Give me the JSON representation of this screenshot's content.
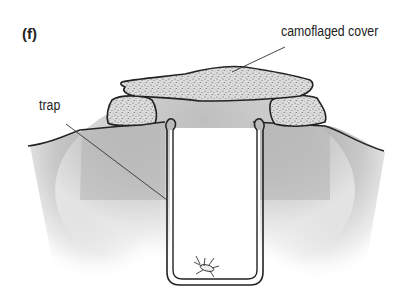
{
  "figure": {
    "panel_label": "(f)"
  },
  "labels": {
    "cover": "camoflaged cover",
    "trap": "trap"
  },
  "components": [
    {
      "name": "camouflaged-cover",
      "description": "flat stippled slab resting on two stones"
    },
    {
      "name": "support-stones",
      "count": 2
    },
    {
      "name": "trap-container",
      "description": "U-shaped cup sunk into soil with rolled rim"
    },
    {
      "name": "insect",
      "location": "bottom of trap"
    },
    {
      "name": "soil",
      "description": "gray shaded ground surface"
    }
  ],
  "colors": {
    "outline": "#222222",
    "soil_shade": "#b8b8b8",
    "stipple_fill": "#d0d0d0",
    "background": "#ffffff"
  }
}
